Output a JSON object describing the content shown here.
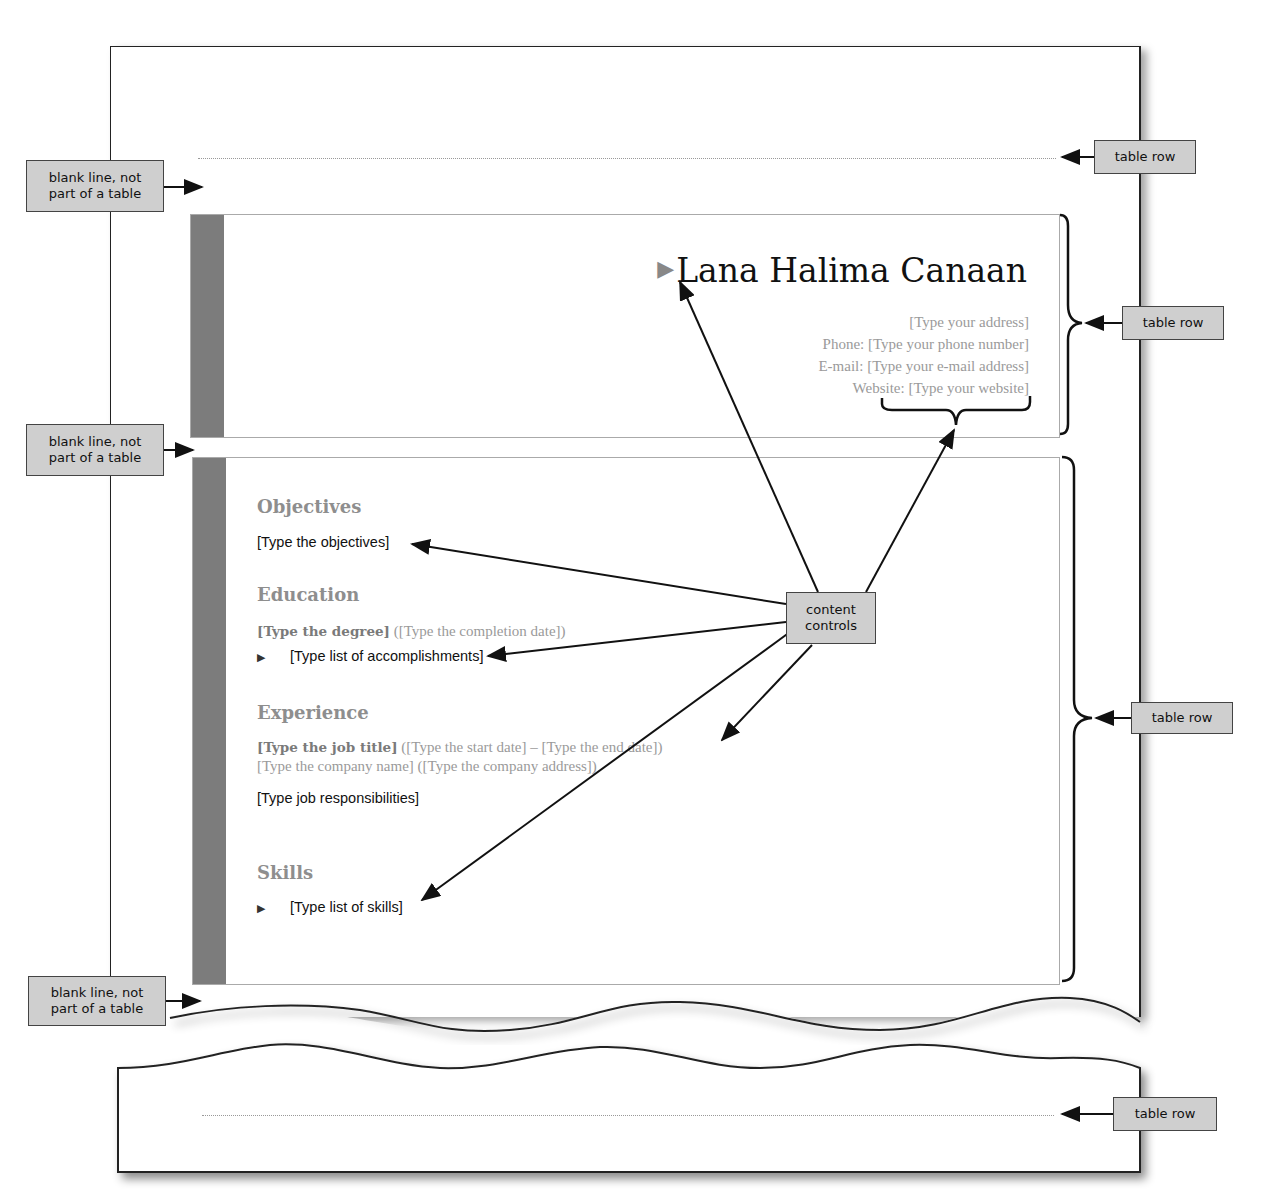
{
  "resume": {
    "name": "Lana Halima Canaan",
    "contact": {
      "address": "[Type your address]",
      "phone": "Phone: [Type your phone number]",
      "email": "E-mail: [Type your e-mail address]",
      "website_label": "Website: ",
      "website": "[Type your website]"
    },
    "sections": {
      "objectives": {
        "heading": "Objectives",
        "text": "[Type the objectives]"
      },
      "education": {
        "heading": "Education",
        "degree": "[Type the degree]",
        "date": " ([Type the completion date])",
        "accomplishments": "[Type list of accomplishments]"
      },
      "experience": {
        "heading": "Experience",
        "job_title": "[Type the job title]",
        "dates": " ([Type the start date] – [Type the end date])",
        "company": "[Type the company name] ([Type the company address])",
        "responsibilities": "[Type job responsibilities]"
      },
      "skills": {
        "heading": "Skills",
        "text": "[Type list of skills]"
      }
    }
  },
  "callouts": {
    "blank_line_1": "blank line, not part of a table",
    "blank_line_2": "blank line, not part of a table",
    "blank_line_3": "blank line, not part of a table",
    "table_row_1": "table row",
    "table_row_2": "table row",
    "table_row_3": "table row",
    "table_row_4": "table row",
    "content_controls": "content controls"
  }
}
